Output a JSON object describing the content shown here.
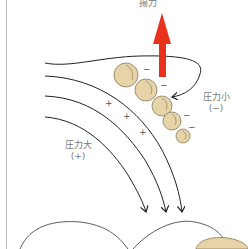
{
  "labels": {
    "lift": "揚力",
    "low_pressure": "圧力小",
    "low_pressure_sign": "(−)",
    "high_pressure": "圧力大",
    "high_pressure_sign": "(+)"
  },
  "signs": {
    "minus": "−",
    "plus": "+"
  },
  "colors": {
    "arrow": "#e8321e",
    "bead_fill": "#e6d3a8",
    "bead_stroke": "#8a7a58",
    "streamline": "#222222"
  }
}
